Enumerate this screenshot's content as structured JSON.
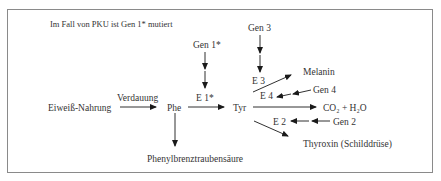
{
  "caption": "Im Fall von PKU ist Gen 1* mutiert",
  "nodes": {
    "eiweiss": "Eiweiß-Nahrung",
    "phe": "Phe",
    "tyr": "Tyr",
    "melanin": "Melanin",
    "co2_h2o": "CO₂ + H₂O",
    "thyroxin": "Thyroxin (Schilddrüse)",
    "phenylbrenz": "Phenylbrenztraubensäure"
  },
  "edges": {
    "verdauung": "Verdauung",
    "e1": "E 1*",
    "e2": "E 2",
    "e3": "E 3",
    "e4": "E 4"
  },
  "genes": {
    "gen1": "Gen 1*",
    "gen2": "Gen 2",
    "gen3": "Gen 3",
    "gen4": "Gen 4"
  },
  "colors": {
    "line": "#1a1a1a",
    "text": "#333333",
    "frame": "#8a8a8a"
  }
}
